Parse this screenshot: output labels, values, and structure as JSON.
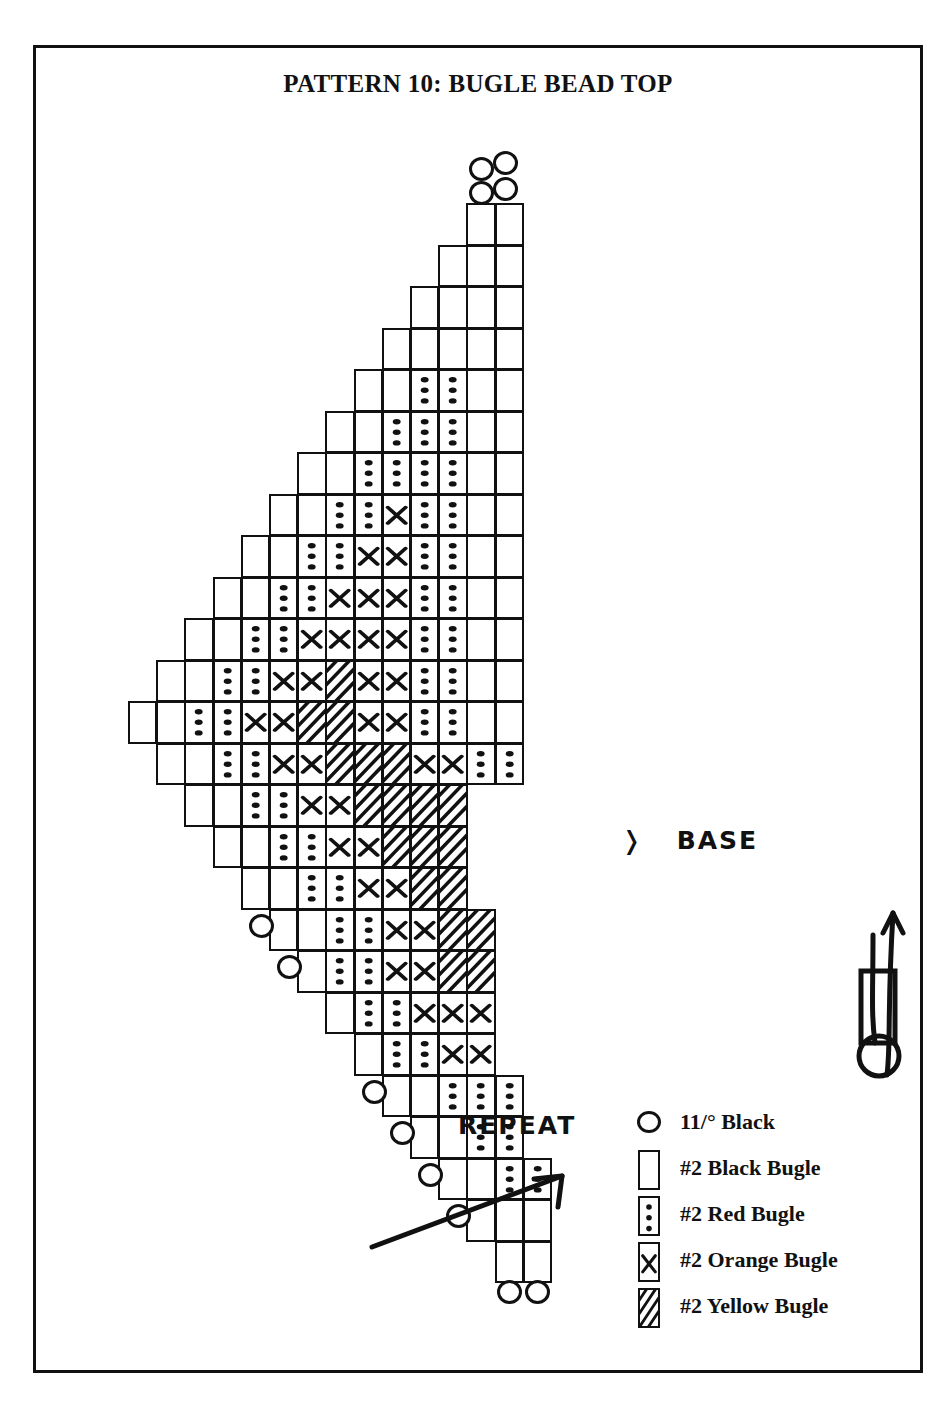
{
  "title": "PATTERN 10:  BUGLE BEAD TOP",
  "annotations": {
    "base": {
      "label": "BASE",
      "marker": "chevron-right"
    },
    "repeat": {
      "label": "REPEAT",
      "marker": "arrow-up-right"
    }
  },
  "legend": {
    "items": [
      {
        "symbol": "circle",
        "code": "seed",
        "label": "11/° Black"
      },
      {
        "symbol": "rect",
        "code": "black",
        "label": "#2 Black Bugle"
      },
      {
        "symbol": "dots",
        "code": "red",
        "label": "#2 Red Bugle"
      },
      {
        "symbol": "cross",
        "code": "orange",
        "label": "#2 Orange Bugle"
      },
      {
        "symbol": "hatch",
        "code": "yellow",
        "label": "#2 Yellow Bugle"
      }
    ]
  },
  "needle_diagram": {
    "name": "thread-path-arrow"
  },
  "chart_data": {
    "type": "table",
    "title": "PATTERN 10:  BUGLE BEAD TOP",
    "bead_codes": [
      "black",
      "red",
      "orange",
      "yellow",
      "seed"
    ],
    "base_row_index": 14,
    "rows": [
      {
        "i": 0,
        "x": 6,
        "beads": [
          "black",
          "black"
        ],
        "seeds_top": 4
      },
      {
        "i": 1,
        "x": 5,
        "beads": [
          "black",
          "black",
          "black"
        ]
      },
      {
        "i": 2,
        "x": 4,
        "beads": [
          "black",
          "black",
          "black",
          "black"
        ]
      },
      {
        "i": 3,
        "x": 3,
        "beads": [
          "black",
          "black",
          "black",
          "black",
          "black"
        ]
      },
      {
        "i": 4,
        "x": 2,
        "beads": [
          "black",
          "black",
          "red",
          "red",
          "black",
          "black"
        ]
      },
      {
        "i": 5,
        "x": 1,
        "beads": [
          "black",
          "black",
          "red",
          "red",
          "red",
          "black",
          "black"
        ]
      },
      {
        "i": 6,
        "x": 0,
        "beads": [
          "black",
          "black",
          "red",
          "red",
          "red",
          "red",
          "black",
          "black"
        ]
      },
      {
        "i": 7,
        "x": -1,
        "beads": [
          "black",
          "black",
          "red",
          "red",
          "orange",
          "red",
          "red",
          "black",
          "black"
        ]
      },
      {
        "i": 8,
        "x": -2,
        "beads": [
          "black",
          "black",
          "red",
          "red",
          "orange",
          "orange",
          "red",
          "red",
          "black",
          "black"
        ]
      },
      {
        "i": 9,
        "x": -3,
        "beads": [
          "black",
          "black",
          "red",
          "red",
          "orange",
          "orange",
          "orange",
          "red",
          "red",
          "black",
          "black"
        ]
      },
      {
        "i": 10,
        "x": -4,
        "beads": [
          "black",
          "black",
          "red",
          "red",
          "orange",
          "orange",
          "orange",
          "orange",
          "red",
          "red",
          "black",
          "black"
        ]
      },
      {
        "i": 11,
        "x": -5,
        "beads": [
          "black",
          "black",
          "red",
          "red",
          "orange",
          "orange",
          "yellow",
          "orange",
          "orange",
          "red",
          "red",
          "black",
          "black"
        ]
      },
      {
        "i": 12,
        "x": -6,
        "beads": [
          "black",
          "black",
          "red",
          "red",
          "orange",
          "orange",
          "yellow",
          "yellow",
          "orange",
          "orange",
          "red",
          "red",
          "black",
          "black"
        ]
      },
      {
        "i": 13,
        "x": -5,
        "beads": [
          "black",
          "black",
          "red",
          "red",
          "orange",
          "orange",
          "yellow",
          "yellow",
          "yellow",
          "orange",
          "orange",
          "red",
          "red"
        ]
      },
      {
        "i": 14,
        "x": -4,
        "beads": [
          "black",
          "black",
          "red",
          "red",
          "orange",
          "orange",
          "yellow",
          "yellow",
          "yellow",
          "yellow"
        ],
        "note": "BASE"
      },
      {
        "i": 15,
        "x": -3,
        "beads": [
          "black",
          "black",
          "red",
          "red",
          "orange",
          "orange",
          "yellow",
          "yellow",
          "yellow"
        ]
      },
      {
        "i": 16,
        "x": -2,
        "beads": [
          "black",
          "black",
          "red",
          "red",
          "orange",
          "orange",
          "yellow",
          "yellow"
        ]
      },
      {
        "i": 17,
        "x": -1,
        "beads": [
          "black",
          "black",
          "red",
          "red",
          "orange",
          "orange",
          "yellow",
          "yellow"
        ],
        "seed_left": true
      },
      {
        "i": 18,
        "x": 0,
        "beads": [
          "black",
          "red",
          "red",
          "orange",
          "orange",
          "yellow",
          "yellow"
        ],
        "seed_left": true
      },
      {
        "i": 19,
        "x": 1,
        "beads": [
          "black",
          "red",
          "red",
          "orange",
          "orange",
          "orange"
        ]
      },
      {
        "i": 20,
        "x": 2,
        "beads": [
          "black",
          "red",
          "red",
          "orange",
          "orange"
        ]
      },
      {
        "i": 21,
        "x": 3,
        "beads": [
          "black",
          "black",
          "red",
          "red",
          "red"
        ],
        "seed_left": true
      },
      {
        "i": 22,
        "x": 4,
        "beads": [
          "black",
          "black",
          "red",
          "red"
        ],
        "seed_left": true
      },
      {
        "i": 23,
        "x": 5,
        "beads": [
          "black",
          "black",
          "red",
          "red"
        ],
        "seed_left": true
      },
      {
        "i": 24,
        "x": 6,
        "beads": [
          "black",
          "black",
          "black"
        ],
        "seed_left": true
      },
      {
        "i": 25,
        "x": 7,
        "beads": [
          "black",
          "black"
        ],
        "seeds_bottom": 2
      }
    ]
  }
}
